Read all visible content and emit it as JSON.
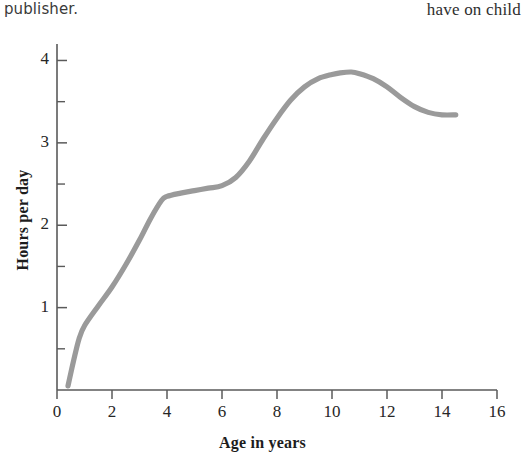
{
  "page": {
    "background_color": "#ffffff",
    "text_fragment_left": "publisher.",
    "text_fragment_right": "have on child"
  },
  "chart_data": {
    "type": "line",
    "title": "",
    "subtitle": "",
    "xlabel": "Age in years",
    "ylabel": "Hours per day",
    "xlim": [
      0,
      16
    ],
    "ylim": [
      0,
      4.2
    ],
    "xticks": [
      0,
      2,
      4,
      6,
      8,
      10,
      12,
      14,
      16
    ],
    "xtick_labels": [
      "0",
      "2",
      "4",
      "6",
      "8",
      "10",
      "12",
      "14",
      "16"
    ],
    "yticks": [
      1,
      2,
      3,
      4
    ],
    "ytick_labels": [
      "1",
      "2",
      "3",
      "4"
    ],
    "ytick_minor": [
      0.5,
      1.5,
      2.5,
      3.5
    ],
    "grid": false,
    "legend": false,
    "legend_position": "none",
    "line_color": "#9a9a9a",
    "line_width": 5.2,
    "axis_color": "#5a5a5a",
    "series": [
      {
        "name": "Television viewing",
        "x": [
          0.4,
          0.6,
          0.8,
          1.0,
          1.5,
          2.0,
          2.5,
          3.0,
          3.4,
          3.8,
          4.0,
          4.5,
          5.0,
          5.5,
          6.0,
          6.5,
          7.0,
          7.5,
          8.0,
          8.5,
          9.0,
          9.5,
          10.0,
          10.3,
          10.7,
          11.0,
          11.5,
          12.0,
          12.5,
          13.0,
          13.5,
          14.0,
          14.5
        ],
        "values": [
          0.05,
          0.35,
          0.62,
          0.78,
          1.02,
          1.25,
          1.52,
          1.82,
          2.08,
          2.3,
          2.35,
          2.39,
          2.42,
          2.45,
          2.48,
          2.58,
          2.78,
          3.05,
          3.3,
          3.52,
          3.68,
          3.78,
          3.83,
          3.85,
          3.86,
          3.84,
          3.78,
          3.68,
          3.55,
          3.44,
          3.37,
          3.34,
          3.34
        ]
      }
    ]
  }
}
